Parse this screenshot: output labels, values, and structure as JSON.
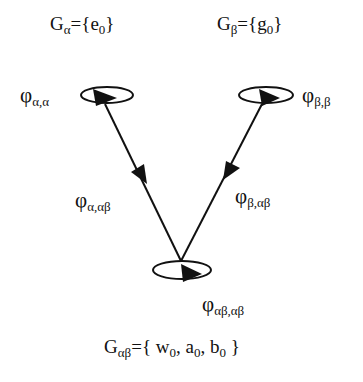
{
  "groups": {
    "alpha": {
      "symbol": "G",
      "sub": "α",
      "set": "={e",
      "elem_sub": "0",
      "close": "}"
    },
    "beta": {
      "symbol": "G",
      "sub": "β",
      "set": "={g",
      "elem_sub": "0",
      "close": "}"
    },
    "alphabeta": {
      "symbol": "G",
      "sub": "αβ",
      "set": "={ w",
      "w_sub": "0",
      "a": ", a",
      "a_sub": "0",
      "b": ", b",
      "b_sub": "0",
      "close": " }"
    }
  },
  "maps": {
    "alpha_alpha": {
      "symbol": "φ",
      "sub": "α,α"
    },
    "beta_beta": {
      "symbol": "φ",
      "sub": "β,β"
    },
    "alpha_alphabeta": {
      "symbol": "φ",
      "sub": "α,αβ"
    },
    "beta_alphabeta": {
      "symbol": "φ",
      "sub": "β,αβ"
    },
    "alphabeta_alphabeta": {
      "symbol": "φ",
      "sub": "αβ,αβ"
    }
  },
  "nodes": [
    {
      "id": "alpha",
      "cx": 107,
      "cy": 95,
      "rx": 26,
      "ry": 8
    },
    {
      "id": "beta",
      "cx": 266,
      "cy": 95,
      "rx": 27,
      "ry": 8
    },
    {
      "id": "alphabeta",
      "cx": 182,
      "cy": 270,
      "rx": 29,
      "ry": 9
    }
  ],
  "edges": [
    {
      "from": "alpha",
      "to": "alphabeta",
      "x1": 105,
      "y1": 104,
      "x2": 181,
      "y2": 261
    },
    {
      "from": "beta",
      "to": "alphabeta",
      "x1": 262,
      "y1": 104,
      "x2": 181,
      "y2": 261
    }
  ],
  "colors": {
    "ink": "#111111",
    "background": "#ffffff"
  }
}
